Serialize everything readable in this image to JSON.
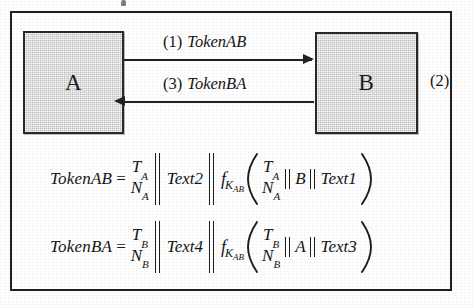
{
  "figure": {
    "annotation_right": "(2)",
    "entities": [
      {
        "id": "a",
        "label": "A"
      },
      {
        "id": "b",
        "label": "B"
      }
    ],
    "messages": [
      {
        "step": "(1)",
        "name": "TokenAB",
        "direction": "a-to-b"
      },
      {
        "step": "(3)",
        "name": "TokenBA",
        "direction": "b-to-a"
      }
    ],
    "equations": [
      {
        "id": "token-ab",
        "lhs": "TokenAB",
        "equals": "=",
        "stack_outer_top": "T",
        "stack_outer_top_sub": "A",
        "stack_outer_bottom": "N",
        "stack_outer_bottom_sub": "A",
        "text_outer": "Text2",
        "mac_f": "f",
        "mac_key": "K",
        "mac_key_sub": "AB",
        "stack_inner_top": "T",
        "stack_inner_top_sub": "A",
        "stack_inner_bottom": "N",
        "stack_inner_bottom_sub": "A",
        "identity": "B",
        "text_inner": "Text1"
      },
      {
        "id": "token-ba",
        "lhs": "TokenBA",
        "equals": "=",
        "stack_outer_top": "T",
        "stack_outer_top_sub": "B",
        "stack_outer_bottom": "N",
        "stack_outer_bottom_sub": "B",
        "text_outer": "Text4",
        "mac_f": "f",
        "mac_key": "K",
        "mac_key_sub": "AB",
        "stack_inner_top": "T",
        "stack_inner_top_sub": "B",
        "stack_inner_bottom": "N",
        "stack_inner_bottom_sub": "B",
        "identity": "A",
        "text_inner": "Text3"
      }
    ],
    "colors": {
      "box_fill": "#d6d6d6",
      "line": "#222222",
      "frame": "#202020",
      "page": "#ffffff"
    }
  }
}
